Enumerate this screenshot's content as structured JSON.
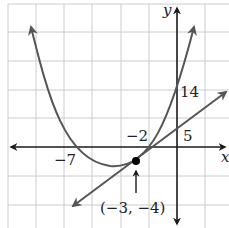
{
  "figure": {
    "type": "graph-of-parabola-and-line",
    "axes": {
      "x_label": "x",
      "y_label": "y"
    },
    "labels": {
      "x_intercept_left": "−7",
      "x_intercept_right": "−2",
      "y_intercept_parabola": "14",
      "y_intercept_line": "5",
      "intersection_point": "(−3, −4)"
    },
    "curves": [
      {
        "name": "parabola",
        "description": "upward-opening parabola with x-intercepts −7 and −2, y-intercept 14"
      },
      {
        "name": "line",
        "description": "line with y-intercept 5 passing through (−3, −4)"
      }
    ],
    "highlighted_point": {
      "x": -3,
      "y": -4
    },
    "colors": {
      "axis": "#1a1a1a",
      "curve": "#555555",
      "grid": "#cccccc",
      "point": "#000000"
    }
  }
}
